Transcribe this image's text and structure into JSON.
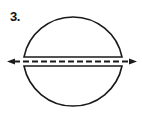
{
  "figure": {
    "label": "3.",
    "colors": {
      "stroke": "#1a1a1a",
      "background": "#ffffff"
    },
    "icons": {
      "left_arrow": "arrow-left-icon",
      "right_arrow": "arrow-right-icon"
    }
  }
}
